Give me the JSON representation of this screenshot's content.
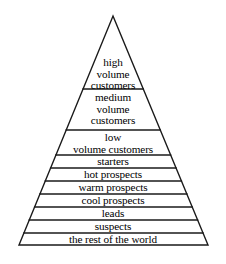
{
  "figure": {
    "name": "customer-loyalty-pyramid",
    "background_color": "#ffffff",
    "line_color": "#1a1a1a",
    "text_color": "#000000",
    "apex": {
      "x": 113,
      "y": 16
    },
    "base_left": {
      "x": 19,
      "y": 245
    },
    "base_right": {
      "x": 208,
      "y": 245
    }
  },
  "bands": [
    {
      "id": "high-volume-customers",
      "lines": [
        "high",
        "volume",
        "customers"
      ],
      "top_y": 55,
      "bottom_y": 89,
      "text_y": 57
    },
    {
      "id": "medium-volume-customers",
      "lines": [
        "medium",
        "volume",
        "customers"
      ],
      "top_y": 89,
      "bottom_y": 130,
      "text_y": 92
    },
    {
      "id": "low-volume-customers",
      "lines": [
        "low",
        "volume customers"
      ],
      "top_y": 130,
      "bottom_y": 155,
      "text_y": 132
    },
    {
      "id": "starters",
      "lines": [
        "starters"
      ],
      "top_y": 155,
      "bottom_y": 168,
      "text_y": 156
    },
    {
      "id": "hot-prospects",
      "lines": [
        "hot prospects"
      ],
      "top_y": 168,
      "bottom_y": 181,
      "text_y": 169
    },
    {
      "id": "warm-prospects",
      "lines": [
        "warm prospects"
      ],
      "top_y": 181,
      "bottom_y": 194,
      "text_y": 182
    },
    {
      "id": "cool-prospects",
      "lines": [
        "cool prospects"
      ],
      "top_y": 194,
      "bottom_y": 207,
      "text_y": 195
    },
    {
      "id": "leads",
      "lines": [
        "leads"
      ],
      "top_y": 207,
      "bottom_y": 220,
      "text_y": 208
    },
    {
      "id": "suspects",
      "lines": [
        "suspects"
      ],
      "top_y": 220,
      "bottom_y": 233,
      "text_y": 221
    },
    {
      "id": "the-rest-of-the-world",
      "lines": [
        "the rest of the world"
      ],
      "top_y": 233,
      "bottom_y": 245,
      "text_y": 234
    }
  ],
  "divider_y_values": [
    89,
    130,
    155,
    168,
    181,
    194,
    207,
    220,
    233,
    245
  ]
}
